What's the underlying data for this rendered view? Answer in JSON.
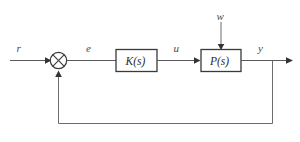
{
  "diagram": {
    "background_color": "#ffffff",
    "line_color": "#5a5a5a",
    "block_border_color": "#3a3a3a",
    "label_color": "#4a4a4a",
    "signals": {
      "reference": "r",
      "error": "e",
      "control": "u",
      "disturbance": "w",
      "output": "y"
    },
    "blocks": {
      "controller": "K(s)",
      "plant": "P(s)"
    },
    "summing_junction": {
      "name": "summing-junction",
      "style": "circle-with-cross"
    }
  }
}
